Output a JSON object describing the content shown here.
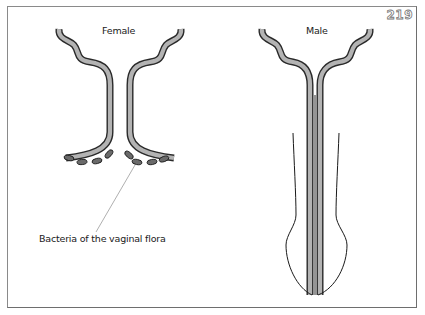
{
  "page_number": "219",
  "panels": {
    "female": {
      "title": "Female"
    },
    "male": {
      "title": "Male"
    }
  },
  "annotations": {
    "bacteria_label": "Bacteria of the vaginal flora"
  },
  "colors": {
    "tube_fill": "#b3b3b3",
    "tube_outline": "#2a2a2a",
    "bacteria_fill": "#6a6a6a",
    "frame": "#8a8a8a",
    "leader_line": "#9a9a9a"
  }
}
